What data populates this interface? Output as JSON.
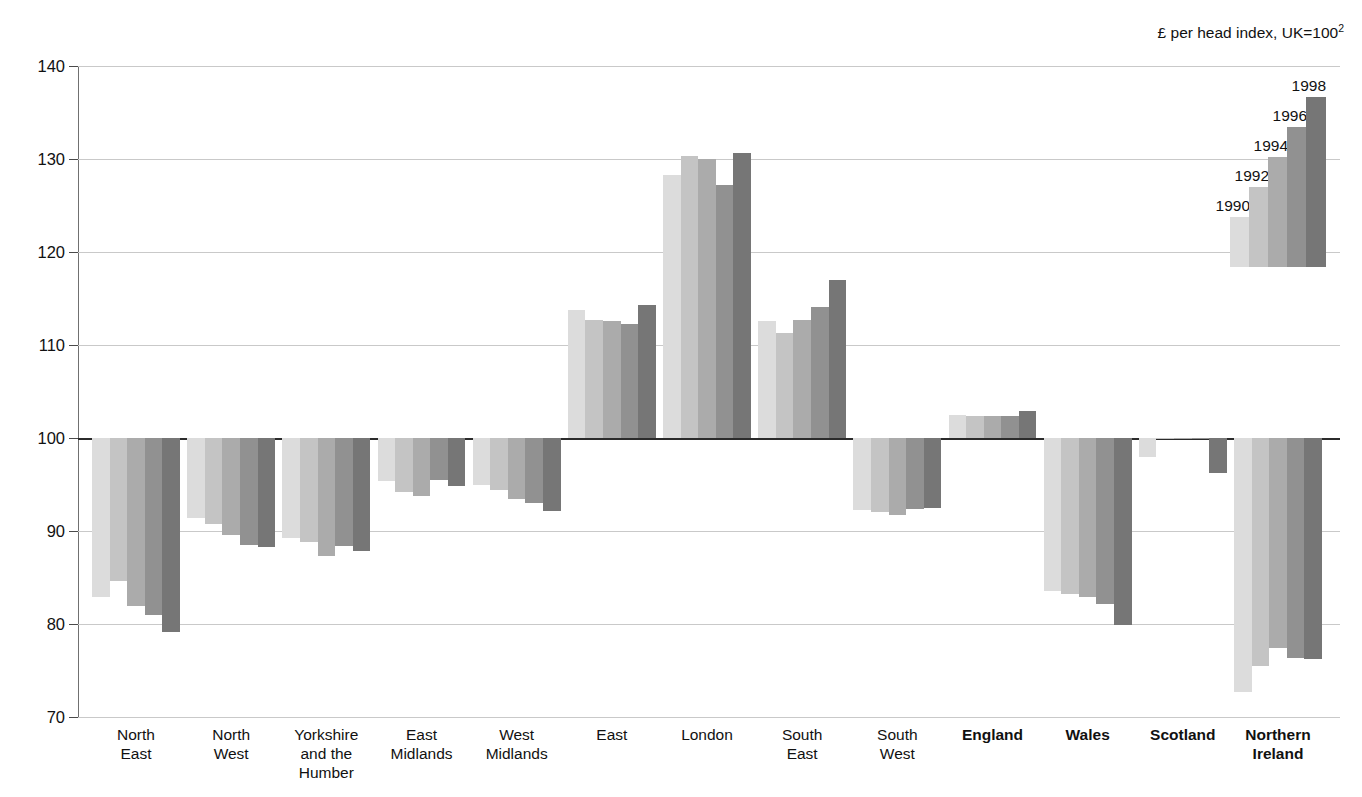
{
  "header": {
    "unit_note": "£ per head index, UK=100",
    "unit_note_superscript": "2"
  },
  "legend": {
    "position": "top-right",
    "entries": [
      {
        "label": "1990",
        "color": "#dcdcdc"
      },
      {
        "label": "1992",
        "color": "#c4c4c4"
      },
      {
        "label": "1994",
        "color": "#ababab"
      },
      {
        "label": "1996",
        "color": "#919191"
      },
      {
        "label": "1998",
        "color": "#767676"
      }
    ]
  },
  "axis": {
    "ticks": [
      "140",
      "130",
      "120",
      "110",
      "100",
      "90",
      "80",
      "70"
    ],
    "min": 70,
    "max": 140,
    "baseline": 100
  },
  "chart_data": {
    "type": "bar",
    "title": "",
    "subtitle": "",
    "xlabel": "",
    "ylabel": "£ per head index, UK=100",
    "ylim": [
      70,
      140
    ],
    "yticks": [
      70,
      80,
      90,
      100,
      110,
      120,
      130,
      140
    ],
    "grid": true,
    "baseline": 100,
    "legend_position": "top-right",
    "categories": [
      "North East",
      "North West",
      "Yorkshire and the Humber",
      "East Midlands",
      "West Midlands",
      "East",
      "London",
      "South East",
      "South West",
      "England",
      "Wales",
      "Scotland",
      "Northern Ireland"
    ],
    "category_bold": [
      false,
      false,
      false,
      false,
      false,
      false,
      false,
      false,
      false,
      true,
      true,
      true,
      true
    ],
    "series": [
      {
        "name": "1990",
        "color": "#dcdcdc",
        "values": [
          82.9,
          91.4,
          89.3,
          95.4,
          95.0,
          113.8,
          128.3,
          112.6,
          92.3,
          102.5,
          83.6,
          98.0,
          72.7
        ]
      },
      {
        "name": "1992",
        "color": "#c4c4c4",
        "values": [
          84.6,
          90.7,
          88.8,
          94.2,
          94.4,
          112.7,
          130.3,
          111.3,
          92.0,
          102.4,
          83.2,
          99.9,
          75.5
        ]
      },
      {
        "name": "1994",
        "color": "#ababab",
        "values": [
          81.9,
          89.6,
          87.3,
          93.8,
          93.4,
          112.6,
          130.0,
          112.7,
          91.7,
          102.4,
          82.9,
          99.9,
          77.4
        ]
      },
      {
        "name": "1996",
        "color": "#919191",
        "values": [
          81.0,
          88.5,
          88.4,
          95.5,
          93.0,
          112.3,
          127.2,
          114.1,
          92.4,
          102.4,
          82.2,
          99.9,
          76.3
        ]
      },
      {
        "name": "1998",
        "color": "#767676",
        "values": [
          79.1,
          88.3,
          87.9,
          94.8,
          92.1,
          114.3,
          130.6,
          117.0,
          92.5,
          102.9,
          79.9,
          96.2,
          76.2
        ]
      }
    ]
  }
}
